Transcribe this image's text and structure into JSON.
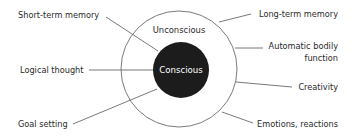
{
  "diagram": {
    "zones": {
      "outer": {
        "label": "Unconscious"
      },
      "inner": {
        "label": "Conscious"
      }
    },
    "left_labels": [
      {
        "label": "Short-term memory"
      },
      {
        "label": "Logical thought"
      },
      {
        "label": "Goal setting"
      }
    ],
    "right_labels": [
      {
        "label": "Long-term memory"
      },
      {
        "label_line1": "Automatic bodily",
        "label_line2": "function"
      },
      {
        "label": "Creativity"
      },
      {
        "label": "Emotions, reactions"
      }
    ],
    "colors": {
      "core_fill": "#1c1c1c",
      "ring_stroke": "#6b6b6b",
      "text": "#2a2a2a",
      "core_text": "#ffffff"
    }
  }
}
